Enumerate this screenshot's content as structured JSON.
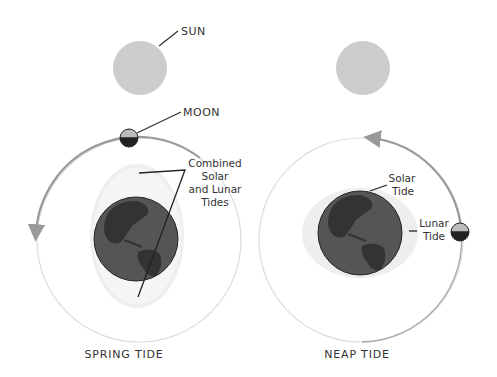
{
  "labels": {
    "sun": "SUN",
    "moon": "MOON",
    "combined_line1": "Combined",
    "combined_line2": "Solar",
    "combined_line3": "and Lunar",
    "combined_line4": "Tides",
    "solar_tide_line1": "Solar",
    "solar_tide_line2": "Tide",
    "lunar_tide_line1": "Lunar",
    "lunar_tide_line2": "Tide",
    "spring_caption": "SPRING TIDE",
    "neap_caption": "NEAP TIDE"
  },
  "colors": {
    "sun": "#cccccc",
    "orbit_faint": "#e0e0e0",
    "orbit_arrow": "#999999",
    "earth": "#555555",
    "land": "#333333",
    "tide_bulge": "#eeeeee",
    "moon_light": "#bbbbbb",
    "moon_dark": "#222222",
    "text": "#333333"
  }
}
